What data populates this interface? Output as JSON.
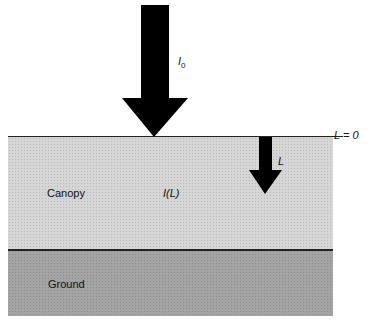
{
  "diagram": {
    "incident_label": "I",
    "incident_subscript": "0",
    "surface_label": "L = 0",
    "depth_label": "L",
    "canopy_label": "Canopy",
    "intensity_label": "I(L)",
    "ground_label": "Ground"
  },
  "colors": {
    "canopy": "#d6d6d6",
    "ground": "#a4a4a4",
    "arrow": "#000000"
  }
}
